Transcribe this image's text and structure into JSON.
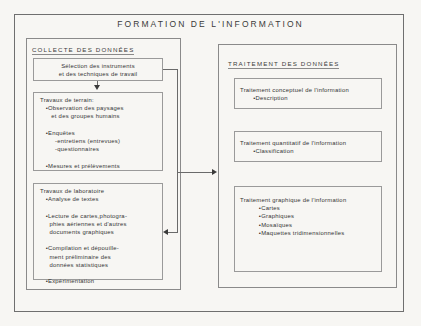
{
  "diagram": {
    "title": "FORMATION DE L'INFORMATION",
    "left_panel": {
      "heading": "COLLECTE DES DONNÉES",
      "boxes": [
        {
          "id": "selection",
          "lines": [
            "Sélection des instruments",
            "et des techniques de travail"
          ]
        },
        {
          "id": "travaux-terrain",
          "lines": [
            "Travaux de terrain:",
            "   •Observation des paysages",
            "      et des groupes humains",
            "",
            "   •Enquêtes",
            "        -entretiens (entrevues)",
            "        -questionnaires",
            "",
            "   •Mesures et prélèvements"
          ]
        },
        {
          "id": "travaux-laboratoire",
          "lines": [
            "Travaux de laboratoire",
            "   •Analyse de textes",
            "",
            "   •Lecture de cartes,photogra-",
            "     phies aériennes et d'autres",
            "     documents graphiques",
            "",
            "   •Compilation et dépouille-",
            "     ment préliminaire des",
            "     données statistiques",
            "",
            "   •Expérimentation"
          ]
        }
      ]
    },
    "right_panel": {
      "heading": "TRAITEMENT DES DONNÉES",
      "boxes": [
        {
          "id": "conceptuel",
          "lines": [
            "Traitement conceptuel de l'information",
            "       •Description"
          ]
        },
        {
          "id": "quantitatif",
          "lines": [
            "Traitement quantitatif de l'information",
            "       •Classification"
          ]
        },
        {
          "id": "graphique",
          "lines": [
            "Traitement graphique de l'information",
            "          •Cartes",
            "          •Graphiques",
            "          •Mosaïques",
            "          •Maquettes tridimensionnelles"
          ]
        }
      ]
    },
    "connectors": [
      {
        "id": "selection-to-terrain",
        "direction": "down"
      },
      {
        "id": "selection-to-laboratoire",
        "direction": "left"
      },
      {
        "id": "collecte-to-traitement",
        "direction": "right"
      }
    ],
    "colors": {
      "background": "#f7f6f3",
      "stroke": "#8a8a8a",
      "text": "#343434",
      "arrow": "#3a3a3a"
    }
  }
}
